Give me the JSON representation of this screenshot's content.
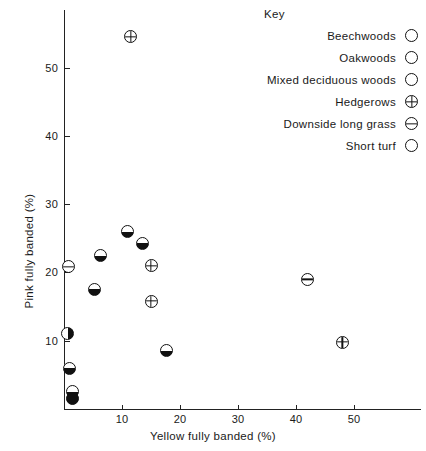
{
  "chart_data": {
    "type": "scatter",
    "title": "",
    "xlabel": "Yellow fully banded (%)",
    "ylabel": "Pink fully banded (%)",
    "xlim": [
      0,
      53
    ],
    "ylim": [
      0,
      57
    ],
    "xticks": [
      "10",
      "20",
      "30",
      "40",
      "50"
    ],
    "xtick_values": [
      10,
      20,
      30,
      40,
      50
    ],
    "yticks": [
      "10",
      "20",
      "30",
      "40",
      "50"
    ],
    "ytick_values": [
      10,
      20,
      30,
      40,
      50
    ],
    "grid": false,
    "legend_position": "top-right",
    "legend_title": "Key",
    "series": [
      {
        "name": "Beechwoods",
        "symbol": "filled-circle",
        "points": [
          [
            1.5,
            1.5
          ]
        ]
      },
      {
        "name": "Oakwoods",
        "symbol": "right-half-filled-circle",
        "points": [
          [
            0.6,
            11.0
          ]
        ]
      },
      {
        "name": "Mixed deciduous woods",
        "symbol": "bottom-half-filled-circle",
        "points": [
          [
            1.0,
            6.0
          ],
          [
            1.5,
            2.6
          ],
          [
            5.2,
            17.5
          ],
          [
            6.3,
            22.5
          ],
          [
            11.0,
            26.0
          ],
          [
            13.6,
            24.2
          ],
          [
            17.6,
            8.5
          ]
        ]
      },
      {
        "name": "Hedgerows",
        "symbol": "crossed-circle",
        "points": [
          [
            11.5,
            54.5
          ],
          [
            15.0,
            21.0
          ],
          [
            15.0,
            15.8
          ],
          [
            48.0,
            9.8
          ]
        ]
      },
      {
        "name": "Downside long grass",
        "symbol": "horizontal-line-circle",
        "points": [
          [
            0.7,
            20.8
          ],
          [
            42.0,
            19.0
          ]
        ]
      },
      {
        "name": "Short turf",
        "symbol": "open-circle",
        "points": []
      }
    ]
  },
  "legend": {
    "title": "Key",
    "items": [
      {
        "label": "Beechwoods",
        "symbol": "filled-circle"
      },
      {
        "label": "Oakwoods",
        "symbol": "right-half-filled-circle"
      },
      {
        "label": "Mixed deciduous woods",
        "symbol": "bottom-half-filled-circle"
      },
      {
        "label": "Hedgerows",
        "symbol": "crossed-circle"
      },
      {
        "label": "Downside long grass",
        "symbol": "horizontal-line-circle"
      },
      {
        "label": "Short turf",
        "symbol": "open-circle"
      }
    ]
  },
  "colors": {
    "marker": "#111111",
    "axis": "#222222",
    "background": "#ffffff"
  }
}
